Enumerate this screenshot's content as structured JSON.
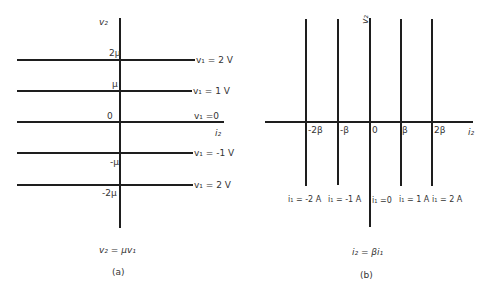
{
  "panel_a": {
    "caption": "(a)",
    "equation": "v₂ = μv₁",
    "y_axis_label": "v₂",
    "x_axis_label": "i₂",
    "tick_labels": [
      "2μ",
      "μ",
      "0",
      "-μ",
      "-2μ"
    ],
    "line_labels": [
      "v₁ = 2 V",
      "v₁ = 1 V",
      "v₁ =0",
      "v₁ = -1 V",
      "v₁ = 2 V"
    ]
  },
  "panel_b": {
    "caption": "(b)",
    "equation": "i₂ = βi₁",
    "y_axis_label": "v₂",
    "x_axis_label": "i₂",
    "tick_labels": [
      "-2β",
      "-β",
      "0",
      "β",
      "2β"
    ],
    "line_labels": [
      "i₁ = -2 A",
      "i₁ = -1 A",
      "i₁ =0",
      "i₁ = 1 A",
      "i₁ = 2 A"
    ]
  }
}
